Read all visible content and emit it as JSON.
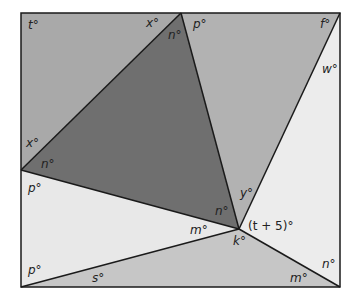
{
  "diagram": {
    "type": "geometry-angle-figure",
    "colors": {
      "top_left_region": "#a9a9a9",
      "central_triangle": "#6f6f6f",
      "top_right_triangle": "#b2b2b2",
      "right_region": "#ececec",
      "left_region": "#e8e8e8",
      "bottom_triangle": "#c6c6c6",
      "stroke": "#1a1a1a"
    },
    "labels": {
      "t_top_left": "t°",
      "x_top": "x°",
      "n_top": "n°",
      "p_top": "p°",
      "f_top_right": "f°",
      "w_right": "w°",
      "x_left": "x°",
      "n_left": "n°",
      "p_left_upper": "p°",
      "y_center": "y°",
      "n_center": "n°",
      "m_center": "m°",
      "t_plus_5": "(t + 5)°",
      "k_center": "k°",
      "p_left_lower": "p°",
      "s_bottom": "s°",
      "m_bottom_right": "m°",
      "n_bottom_right": "n°"
    }
  }
}
